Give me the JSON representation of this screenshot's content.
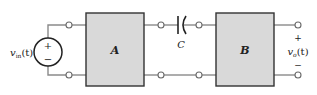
{
  "diagram": {
    "source": {
      "label_main": "v",
      "label_sub": "in",
      "label_arg": "(t)",
      "plus": "+",
      "minus": "−"
    },
    "block_a": {
      "label": "A"
    },
    "block_b": {
      "label": "B"
    },
    "capacitor": {
      "label": "C"
    },
    "output": {
      "label_main": "v",
      "label_sub": "o",
      "label_arg": "(t)",
      "plus": "+",
      "minus": "−"
    },
    "colors": {
      "block_fill": "#d9d9d9",
      "block_stroke": "#333333",
      "wire": "#8a8a8a"
    }
  }
}
